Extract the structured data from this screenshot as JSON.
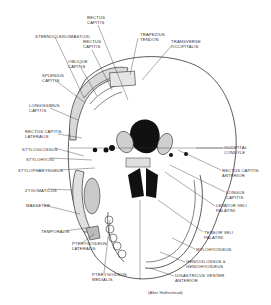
{
  "figure": {
    "credit": "(After Hollinshead)",
    "labels_top": [
      {
        "id": "rectus-capitis-top",
        "text": "RECTUS\nCAPITIS",
        "x": 87,
        "y": 15
      },
      {
        "id": "sternocleidomastoid",
        "text": "STERNOCLEIDOMASTOID",
        "x": 35,
        "y": 34
      },
      {
        "id": "rectus-capitis-2",
        "text": "RECTUS\nCAPITIS",
        "x": 83,
        "y": 39
      },
      {
        "id": "trapezius-tendon",
        "text": "TRAPEZIUS\nTENDON",
        "x": 140,
        "y": 32
      },
      {
        "id": "transverse-occipitalis",
        "text": "TRANSVERSE\nOCCIPITALIS",
        "x": 171,
        "y": 39
      },
      {
        "id": "oblique-capitis",
        "text": "OBLIQUE\nCAPITIS",
        "x": 68,
        "y": 59
      },
      {
        "id": "splenius-capitis",
        "text": "SPLENIUS\nCAPITIS",
        "x": 42,
        "y": 73
      }
    ],
    "labels_left": [
      {
        "id": "longissimus-capitis",
        "text": "LONGISSIMUS\nCAPITIS",
        "x": 29,
        "y": 103
      },
      {
        "id": "rectus-capitis-lateralis",
        "text": "RECTUS CAPITIS\nLATERALIS",
        "x": 25,
        "y": 129
      },
      {
        "id": "styloglossus",
        "text": "STYLOGLOSSUS",
        "x": 22,
        "y": 147
      },
      {
        "id": "stylohyoid",
        "text": "STYLOHYOID",
        "x": 26,
        "y": 157
      },
      {
        "id": "stylopharyngeus",
        "text": "STYLOPHARYNGEUS",
        "x": 18,
        "y": 168
      },
      {
        "id": "zygomaticus",
        "text": "ZYGOMATICUS",
        "x": 25,
        "y": 188
      },
      {
        "id": "masseter",
        "text": "MASSETER",
        "x": 26,
        "y": 203
      },
      {
        "id": "temporalis",
        "text": "TEMPORALIS",
        "x": 41,
        "y": 229
      }
    ],
    "labels_bottom": [
      {
        "id": "pterygoideus-lateralis",
        "text": "PTERYGOIDEUS\nLATERALIS",
        "x": 72,
        "y": 241
      },
      {
        "id": "pterygoideus-medialis",
        "text": "PTERYGOIDEUS\nMEDIALIS",
        "x": 92,
        "y": 272
      },
      {
        "id": "mylohyoideus",
        "text": "MYLOHYOIDEUS",
        "x": 196,
        "y": 247
      },
      {
        "id": "geniohyoid",
        "text": "GENIOGLOSSUS &\nGENIOHYOIDEUS",
        "x": 186,
        "y": 259
      },
      {
        "id": "digastricus",
        "text": "DIGASTRICUS VENTER\nANTERIOR",
        "x": 175,
        "y": 273
      }
    ],
    "labels_right": [
      {
        "id": "occipital-condyle",
        "text": "OCCIPITAL\nCONDYLE",
        "x": 224,
        "y": 145
      },
      {
        "id": "rectus-capitis-anterior",
        "text": "RECTUS CAPITIS\nANTERIOR",
        "x": 222,
        "y": 168
      },
      {
        "id": "longus-capitis",
        "text": "LONGUS\nCAPITIS",
        "x": 226,
        "y": 190
      },
      {
        "id": "levator-veli-palatini",
        "text": "LEVATOR VELI\nPALATINI",
        "x": 216,
        "y": 203
      },
      {
        "id": "tensor-veli-palatini",
        "text": "TENSOR VELI\nPALATINI",
        "x": 204,
        "y": 230
      }
    ],
    "credit_pos": {
      "x": 148,
      "y": 290
    },
    "colors": {
      "ink": "#222222",
      "paper": "#ffffff",
      "fill": "#111111",
      "hatch": "#9a9a9a"
    }
  }
}
